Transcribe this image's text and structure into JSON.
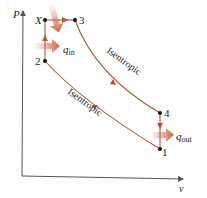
{
  "diagram": {
    "type": "P-v diagram",
    "axes": {
      "y_label": "P",
      "x_label": "v"
    },
    "points": [
      {
        "id": "X",
        "label": "X"
      },
      {
        "id": "3",
        "label": "3"
      },
      {
        "id": "2",
        "label": "2"
      },
      {
        "id": "4",
        "label": "4"
      },
      {
        "id": "1",
        "label": "1"
      }
    ],
    "processes": [
      {
        "from": "2",
        "to": "X",
        "kind": "constant volume"
      },
      {
        "from": "X",
        "to": "3",
        "kind": "constant pressure"
      },
      {
        "from": "3",
        "to": "4",
        "kind": "Isentropic",
        "label": "Isentropic"
      },
      {
        "from": "4",
        "to": "1",
        "kind": "constant volume"
      },
      {
        "from": "1",
        "to": "2",
        "kind": "Isentropic",
        "label": "Isentropic"
      }
    ],
    "heat": {
      "in_label_main": "q",
      "in_label_sub": "in",
      "out_label_main": "q",
      "out_label_sub": "out"
    },
    "colors": {
      "curve": "#b5533a",
      "heat_arrow": "#d9735a",
      "axis": "#555555"
    }
  }
}
